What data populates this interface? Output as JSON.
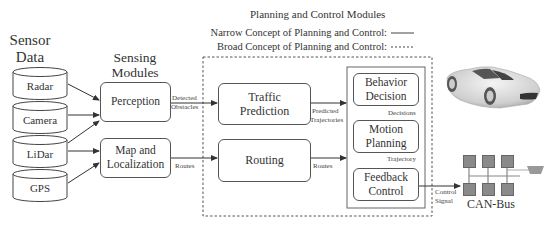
{
  "header": {
    "title": "Planning and Control Modules",
    "legend": [
      {
        "label": "Narrow Concept of Planning and Control:",
        "style": "solid"
      },
      {
        "label": "Broad Concept of Planning and Control:",
        "style": "dashed"
      }
    ]
  },
  "sensor_data": {
    "title_line1": "Sensor",
    "title_line2": "Data",
    "items": [
      "Radar",
      "Camera",
      "LiDar",
      "GPS"
    ]
  },
  "sensing_modules": {
    "title_line1": "Sensing",
    "title_line2": "Modules",
    "perception": "Perception",
    "map_line1": "Map and",
    "map_line2": "Localization"
  },
  "planning": {
    "traffic_line1": "Traffic",
    "traffic_line2": "Prediction",
    "routing": "Routing",
    "behavior_line1": "Behavior",
    "behavior_line2": "Decision",
    "motion_line1": "Motion",
    "motion_line2": "Planning",
    "feedback_line1": "Feedback",
    "feedback_line2": "Control"
  },
  "edge_labels": {
    "detected_line1": "Detected",
    "detected_line2": "Obstacles",
    "routes_1": "Routes",
    "predicted_line1": "Predicted",
    "predicted_line2": "Trajectories",
    "routes_2": "Routes",
    "decisions": "Decisions",
    "trajectory": "Trajectory",
    "control_line1": "Control",
    "control_line2": "Signal"
  },
  "can_bus": {
    "label": "CAN-Bus",
    "nodes": [
      "1",
      "2",
      "3",
      "4",
      "5",
      "6"
    ]
  },
  "colors": {
    "line": "#444444",
    "box_border": "#555555",
    "node_fill": "#8a8a8a"
  }
}
